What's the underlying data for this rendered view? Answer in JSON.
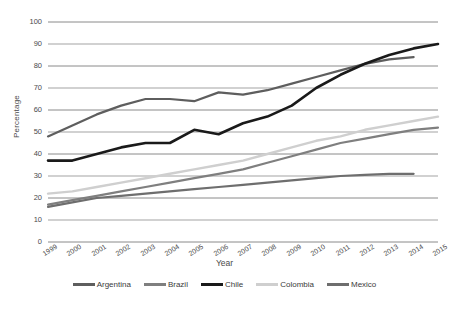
{
  "chart_data": {
    "type": "line",
    "title": "",
    "xlabel": "Year",
    "ylabel": "Percentage",
    "x": [
      1999,
      2000,
      2001,
      2002,
      2003,
      2004,
      2005,
      2006,
      2007,
      2008,
      2009,
      2010,
      2011,
      2012,
      2013,
      2014,
      2015
    ],
    "categories": [
      "1999",
      "2000",
      "2001",
      "2002",
      "2003",
      "2004",
      "2005",
      "2006",
      "2007",
      "2008",
      "2009",
      "2010",
      "2011",
      "2012",
      "2013",
      "2014",
      "2015"
    ],
    "xlim": [
      1999,
      2015
    ],
    "ylim": [
      0,
      100
    ],
    "yticks": [
      0,
      10,
      20,
      30,
      40,
      50,
      60,
      70,
      80,
      90,
      100
    ],
    "grid": "horizontal",
    "legend_position": "bottom",
    "series": [
      {
        "name": "Argentina",
        "color": "#5e5e5e",
        "width": 2.2,
        "values": [
          48,
          53,
          58,
          62,
          65,
          65,
          64,
          68,
          67,
          69,
          72,
          75,
          78,
          81,
          83,
          84,
          null
        ]
      },
      {
        "name": "Brazil",
        "color": "#7f7f7f",
        "width": 2.2,
        "values": [
          17,
          19,
          21,
          23,
          25,
          27,
          29,
          31,
          33,
          36,
          39,
          42,
          45,
          47,
          49,
          51,
          52
        ]
      },
      {
        "name": "Chile",
        "color": "#1a1a1a",
        "width": 2.6,
        "values": [
          37,
          37,
          40,
          43,
          45,
          45,
          51,
          49,
          54,
          57,
          62,
          70,
          76,
          81,
          85,
          88,
          90
        ]
      },
      {
        "name": "Colombia",
        "color": "#cfcfcf",
        "width": 2.4,
        "values": [
          22,
          23,
          25,
          27,
          29,
          31,
          33,
          35,
          37,
          40,
          43,
          46,
          48,
          51,
          53,
          55,
          57
        ]
      },
      {
        "name": "Mexico",
        "color": "#6e6e6e",
        "width": 2.2,
        "values": [
          16,
          18,
          20,
          21,
          22,
          23,
          24,
          25,
          26,
          27,
          28,
          29,
          30,
          30.5,
          31,
          31,
          null
        ]
      }
    ]
  },
  "axis": {
    "y_title": "Percentage",
    "x_title": "Year"
  },
  "colors": {
    "gridline": "#7d7d7d",
    "text": "#3b3b3b",
    "background": "#ffffff"
  }
}
